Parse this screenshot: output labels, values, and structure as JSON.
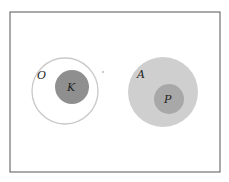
{
  "diagram": {
    "frame": {
      "x": 10,
      "y": 12,
      "width": 210,
      "height": 160,
      "stroke": "#555555"
    },
    "left_group": {
      "outer": {
        "label": "O",
        "cx": 65,
        "cy": 91,
        "r": 33,
        "stroke": "#c9c9c9",
        "fill": "#ffffff"
      },
      "inner": {
        "label": "K",
        "cx": 72,
        "cy": 87,
        "r": 17,
        "fill": "#8f8f8f"
      },
      "dot": {
        "cx": 103,
        "cy": 72,
        "r": 1,
        "fill": "#bbbbbb"
      }
    },
    "right_group": {
      "outer": {
        "label": "A",
        "cx": 163,
        "cy": 92,
        "r": 35,
        "fill": "#cfcfcf"
      },
      "inner": {
        "label": "P",
        "cx": 169,
        "cy": 99,
        "r": 15,
        "fill": "#a8a8a8"
      }
    }
  }
}
